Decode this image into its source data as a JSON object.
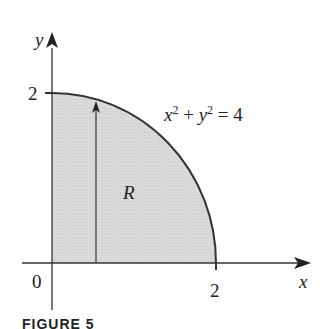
{
  "diagram": {
    "axes": {
      "x_label": "x",
      "y_label": "y",
      "origin_label": "0"
    },
    "ticks": {
      "x_tick": "2",
      "y_tick": "2"
    },
    "curve_equation": {
      "x_var": "x",
      "x_exp": "2",
      "plus": "+",
      "y_var": "y",
      "y_exp": "2",
      "rhs": "= 4"
    },
    "region_label": "R",
    "region_fill": "#d9d9d9",
    "caption": "FIGURE 5"
  }
}
